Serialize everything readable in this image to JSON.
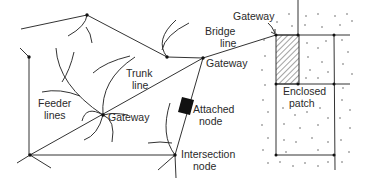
{
  "diagram": {
    "labels": {
      "bridge_line_1": "Bridge",
      "bridge_line_2": "line",
      "gateway_top": "Gateway",
      "gateway_right": "Gateway",
      "gateway_center": "Gateway",
      "trunk_line_1": "Trunk",
      "trunk_line_2": "line",
      "feeder_lines_1": "Feeder",
      "feeder_lines_2": "lines",
      "attached_node_1": "Attached",
      "attached_node_2": "node",
      "intersection_node_1": "Intersection",
      "intersection_node_2": "node",
      "enclosed_patch_1": "Enclosed",
      "enclosed_patch_2": "patch"
    },
    "nodes": [
      {
        "id": "top",
        "x": 87,
        "y": 15
      },
      {
        "id": "left",
        "x": 29,
        "y": 57
      },
      {
        "id": "junction",
        "x": 167,
        "y": 57
      },
      {
        "id": "gateway-right",
        "x": 203,
        "y": 58
      },
      {
        "id": "gateway-center",
        "x": 103,
        "y": 115
      },
      {
        "id": "bottom-left",
        "x": 30,
        "y": 155
      },
      {
        "id": "intersection",
        "x": 175,
        "y": 155
      },
      {
        "id": "gateway-bridge",
        "x": 276,
        "y": 35
      }
    ],
    "colors": {
      "line": "#333333",
      "text": "#2a2a2a",
      "background": "#ffffff"
    }
  }
}
